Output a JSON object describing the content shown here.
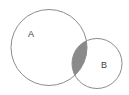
{
  "figure": {
    "name": "venn-diagram-two-sets",
    "background_color": "#ffffff",
    "width": 129,
    "height": 95
  },
  "chart_data": {
    "type": "diagram",
    "diagram_kind": "venn",
    "title": "",
    "set_count": 2,
    "sets": [
      {
        "id": "A",
        "label": "A",
        "center_x": 49,
        "center_y": 47.5,
        "radius": 38,
        "fill": "#ffffff",
        "stroke": "#8c8c8c",
        "stroke_width": 1,
        "label_x": 31,
        "label_y": 35
      },
      {
        "id": "B",
        "label": "B",
        "center_x": 97,
        "center_y": 63.5,
        "radius": 25,
        "fill": "#ffffff",
        "stroke": "#8c8c8c",
        "stroke_width": 1,
        "label_x": 104,
        "label_y": 66
      }
    ],
    "regions": [
      {
        "id": "A-only",
        "label": "A",
        "shaded": false,
        "fill": "#ffffff"
      },
      {
        "id": "B-only",
        "label": "B",
        "shaded": false,
        "fill": "#ffffff"
      },
      {
        "id": "A-intersect-B",
        "label": "",
        "shaded": true,
        "fill": "#8a8a8a",
        "description": "intersection of A and B shaded dark gray"
      }
    ],
    "colors": {
      "stroke": "#8c8c8c",
      "shaded_region": "#8a8a8a",
      "background": "#ffffff",
      "label_text": "#404040"
    }
  },
  "labels": {
    "set_a": "A",
    "set_b": "B"
  }
}
